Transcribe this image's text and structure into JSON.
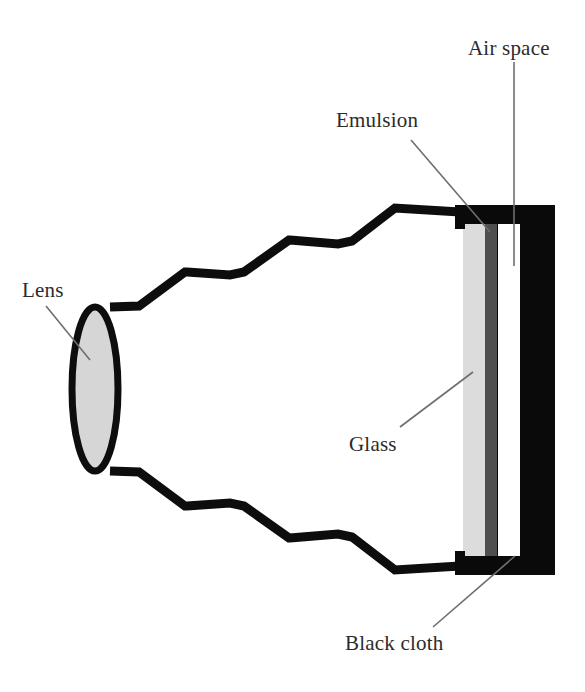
{
  "diagram": {
    "colors": {
      "outline": "#000000",
      "lens_fill": "#d6d6d6",
      "glass_fill": "#dcdcdc",
      "emulsion_fill": "#4f4f4f",
      "air_fill": "#ffffff",
      "cloth_fill": "#0a0a0a",
      "leader_line": "#6e6e6e",
      "text": "#2b2b2b",
      "background": "#ffffff"
    },
    "labels": {
      "lens": "Lens",
      "emulsion": "Emulsion",
      "air_space": "Air space",
      "glass": "Glass",
      "black_cloth": "Black cloth"
    },
    "parts": {
      "lens": "lens-ellipse",
      "bellows_top": "bellows-top-zigzag",
      "bellows_bottom": "bellows-bottom-zigzag",
      "frame": "black-cloth-frame",
      "glass": "glass-plate",
      "emulsion": "emulsion-layer",
      "air_space": "air-gap"
    }
  }
}
